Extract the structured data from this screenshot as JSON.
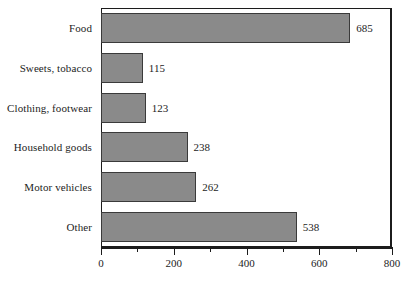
{
  "chart_data": {
    "type": "bar",
    "orientation": "horizontal",
    "title": "",
    "subtitle": "",
    "xlabel": "",
    "ylabel": "",
    "categories": [
      "Food",
      "Sweets, tobacco",
      "Clothing, footwear",
      "Household goods",
      "Motor vehicles",
      "Other"
    ],
    "values": [
      685,
      115,
      123,
      238,
      262,
      538
    ],
    "data_labels": [
      "685",
      "115",
      "123",
      "238",
      "262",
      "538"
    ],
    "xlim": [
      0,
      800
    ],
    "x_major_ticks": [
      0,
      200,
      400,
      600,
      800
    ],
    "x_tick_labels": [
      "0",
      "200",
      "400",
      "600",
      "800"
    ],
    "x_minor_ticks": [
      100,
      300,
      500,
      700
    ],
    "grid": false,
    "legend": null,
    "bar_color": "#8a8a8a",
    "bar_border_color": "#3a3a3a",
    "axis_color": "#1c1c1c",
    "background_color": "#ffffff",
    "text_color": "#1d1d1d"
  }
}
